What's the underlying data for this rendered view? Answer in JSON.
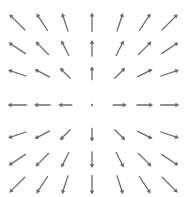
{
  "chart_data": {
    "type": "quiver",
    "title": "",
    "grid": {
      "x": [
        -3,
        -2,
        -1,
        0,
        1,
        2,
        3
      ],
      "y": [
        3,
        2,
        1,
        0,
        -1,
        -2,
        -3
      ]
    },
    "field": "F(x, y) = (x, y)",
    "pixel_columns": [
      17,
      42,
      65,
      92,
      120,
      145,
      170
    ],
    "pixel_rows": [
      22,
      48,
      73,
      105,
      135,
      160,
      185
    ],
    "center": [
      92,
      105
    ],
    "axes_visible": false,
    "grid_lines": false,
    "legend": null,
    "color": "#6b6b6b"
  }
}
